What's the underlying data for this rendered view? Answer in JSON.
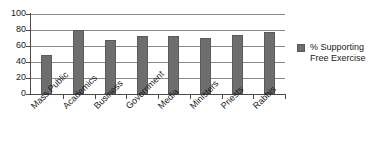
{
  "chart_data": {
    "type": "bar",
    "title": "",
    "subtitle": "",
    "xlabel": "",
    "ylabel": "",
    "ylim": [
      0,
      100
    ],
    "ytick_values": [
      0,
      20,
      40,
      60,
      80,
      100
    ],
    "ytick_labels": [
      "0",
      "20",
      "40",
      "60",
      "80",
      "100"
    ],
    "grid": "horizontal",
    "legend_position": "right",
    "categories": [
      "Mass Public",
      "Academics",
      "Business",
      "Government",
      "Media",
      "Ministers",
      "Priests",
      "Rabbis"
    ],
    "series": [
      {
        "name": "% Supporting Free Exercise",
        "color": "#6e6e6e",
        "values": [
          49,
          80,
          67,
          73,
          73,
          70,
          74,
          78
        ]
      }
    ]
  },
  "legend": {
    "entries": [
      {
        "label_line1": "% Supporting",
        "label_line2": "Free Exercise",
        "swatch_color": "#6e6e6e"
      }
    ]
  },
  "axes": {
    "y": {
      "ticks": [
        "100",
        "80",
        "60",
        "40",
        "20",
        "0"
      ]
    }
  }
}
